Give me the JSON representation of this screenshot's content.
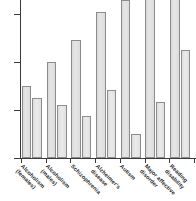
{
  "chart_data": {
    "type": "bar",
    "title": "",
    "subtitle": "",
    "xlabel": "",
    "ylabel": "",
    "ylim": [
      0,
      0.72
    ],
    "xlim": [
      0,
      7
    ],
    "grid": false,
    "legend_position": "none",
    "y_ticks": [
      {
        "value": 0,
        "label": "0"
      },
      {
        "value": 0.2,
        "label": "0.2"
      },
      {
        "value": 0.4,
        "label": "0.4"
      },
      {
        "value": 0.6,
        "label": "0.6"
      }
    ],
    "categories": [
      "Alcoholism (females)",
      "Alcoholism (males)",
      "Schizophrenia",
      "Alzheimer's disease",
      "Autism",
      "Major affective disorder",
      "Reading disability"
    ],
    "category_lines": [
      [
        "Alcoholism",
        "(females)"
      ],
      [
        "Alcoholism",
        "(males)"
      ],
      [
        "Schizophrenia"
      ],
      [
        "Alzheimer's",
        "disease"
      ],
      [
        "Autism"
      ],
      [
        "Major affective",
        "disorder"
      ],
      [
        "Reading",
        "disability"
      ]
    ],
    "series": [
      {
        "name": "series-a",
        "color": "#e0e0e0",
        "values": [
          0.3,
          0.4,
          0.49,
          0.61,
          0.66,
          0.72,
          0.72
        ],
        "clipped": [
          false,
          false,
          false,
          false,
          false,
          true,
          true
        ]
      },
      {
        "name": "series-b",
        "color": "#e6e6e6",
        "values": [
          0.25,
          0.22,
          0.175,
          0.285,
          0.1,
          0.235,
          0.45
        ],
        "clipped": [
          false,
          false,
          false,
          false,
          false,
          false,
          false
        ]
      }
    ]
  },
  "axis": {
    "axis_color": "#3a3a3a",
    "bar_edge_color": "#8c8c8c"
  }
}
